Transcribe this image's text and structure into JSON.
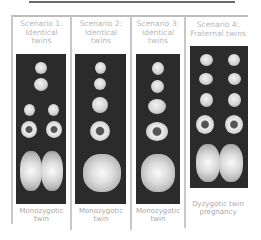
{
  "figure": {
    "panels": [
      {
        "header": [
          "Scenario 1:",
          "Identical",
          "twins"
        ],
        "caption": [
          "Monozygotic",
          "twin"
        ]
      },
      {
        "header": [
          "Scenario 2:",
          "Identical",
          "twins"
        ],
        "caption": [
          "Monozygotic",
          "twin"
        ]
      },
      {
        "header": [
          "Scenario 3:",
          "Identical",
          "twins"
        ],
        "caption": [
          "Monozygotic",
          "twin"
        ]
      },
      {
        "header": [
          "Scenario 4:",
          "Fraternal twins"
        ],
        "caption": [
          "Dyzygotic twin",
          "pregnancy"
        ]
      }
    ],
    "colors": {
      "image_bg": "#2b2b2b",
      "header_text": "#b8b8b8",
      "caption_text": "#a8a8a8",
      "border": "#c8c8c8"
    }
  }
}
